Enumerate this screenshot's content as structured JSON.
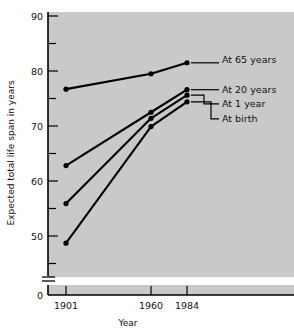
{
  "chart_data": {
    "type": "line",
    "title": "",
    "xlabel": "Year",
    "ylabel": "Expected total life span in years",
    "x": [
      1901,
      1960,
      1984
    ],
    "xtick_labels": [
      "1901",
      "1960",
      "1984"
    ],
    "ytick_labels": [
      "90",
      "80",
      "70",
      "60",
      "50",
      "0"
    ],
    "yticks_major": [
      90,
      80,
      70,
      60,
      50
    ],
    "yticks_minor": [
      85,
      75,
      65,
      55,
      45
    ],
    "ylim": [
      45,
      90
    ],
    "y_axis_break": true,
    "y_axis_zero_label": "0",
    "grid": false,
    "legend_position": "right-inline-labels",
    "series": [
      {
        "name": "At 65 years",
        "label": "At 65 years",
        "values": [
          76.7,
          79.5,
          81.5
        ]
      },
      {
        "name": "At 20 years",
        "label": "At 20 years",
        "values": [
          62.8,
          72.5,
          76.6
        ]
      },
      {
        "name": "At 1 year",
        "label": "At 1 year",
        "values": [
          55.9,
          71.4,
          75.6
        ]
      },
      {
        "name": "At birth",
        "label": "At birth",
        "values": [
          48.7,
          69.9,
          74.4
        ]
      }
    ],
    "colors": {
      "plot_background": "#c9c9c9",
      "page_background": "#ffffff",
      "line": "#000000",
      "marker": "#000000",
      "axis": "#000000",
      "text": "#111111"
    }
  }
}
